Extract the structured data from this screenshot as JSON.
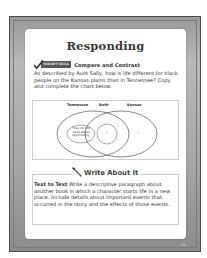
{
  "page": {
    "title": "Responding",
    "page_number": "11"
  },
  "skill": {
    "badge_label": "TARGET SKILL",
    "name": "Compare and Contrast",
    "icon": "checkmark-icon",
    "question": "As described by Aunt Sally, how is life different for black people on the Kansas plains than in Tennessee? Copy and complete the chart below."
  },
  "venn": {
    "labels": [
      "Tennessee",
      "Both",
      "Kansas"
    ],
    "left_text": "They do not have equal opportunity.",
    "center_text": "?",
    "right_text": "?"
  },
  "write": {
    "title": "Write About It",
    "icon": "pencil-icon",
    "lead": "Text to Text",
    "body": " Write a descriptive paragraph about another book in which a character starts life in a new place. Include details about important events that occurred in the story and the effects of those events."
  },
  "colors": {
    "frame": "#a8a8a8",
    "frame_border": "#4a4a4a",
    "badge": "#5a5a5a",
    "text": "#333333",
    "box_border": "#cfcfcf"
  }
}
